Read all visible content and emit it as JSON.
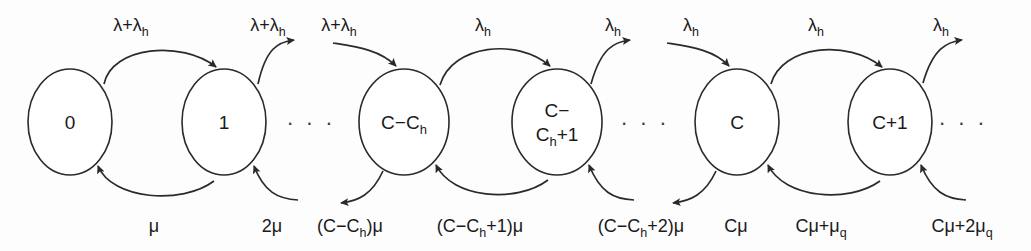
{
  "diagram": {
    "type": "markov-chain-state-transition-diagram",
    "title": "",
    "background_color": "#fdfdfd",
    "stroke_color": "#2a2a2a",
    "text_color": "#1a1a1a",
    "states": [
      {
        "id": "s0",
        "label": "0",
        "label_lines": [
          "0"
        ],
        "cx": 70,
        "cy": 122,
        "rx": 42,
        "ry": 53
      },
      {
        "id": "s1",
        "label": "1",
        "label_lines": [
          "1"
        ],
        "cx": 224,
        "cy": 122,
        "rx": 42,
        "ry": 53
      },
      {
        "id": "sCCh",
        "label": "C-C_h",
        "label_lines": [
          "C−C",
          "h"
        ],
        "cx": 404,
        "cy": 122,
        "rx": 45,
        "ry": 53
      },
      {
        "id": "sCCh1",
        "label": "C-C_h+1",
        "label_lines": [
          "C−",
          "C",
          "h",
          "+1"
        ],
        "cx": 557,
        "cy": 122,
        "rx": 45,
        "ry": 53
      },
      {
        "id": "sC",
        "label": "C",
        "label_lines": [
          "C"
        ],
        "cx": 737,
        "cy": 122,
        "rx": 42,
        "ry": 53
      },
      {
        "id": "sC1",
        "label": "C+1",
        "label_lines": [
          "C+1"
        ],
        "cx": 890,
        "cy": 122,
        "rx": 42,
        "ry": 53
      }
    ],
    "ellipses_gaps": [
      {
        "id": "gap1",
        "text": "· · ·",
        "x": 311,
        "y": 130
      },
      {
        "id": "gap2",
        "text": "· · ·",
        "x": 645,
        "y": 130
      },
      {
        "id": "gap3",
        "text": "· · ·",
        "x": 963,
        "y": 130
      }
    ],
    "arrival_labels": [
      {
        "id": "a1",
        "text": "λ+λ",
        "sub": "h",
        "x": 131,
        "y": 31,
        "kind": "lambda-plus-lambda-h"
      },
      {
        "id": "a2",
        "text": "λ+λ",
        "sub": "h",
        "x": 268,
        "y": 31,
        "kind": "lambda-plus-lambda-h"
      },
      {
        "id": "a3",
        "text": "λ+λ",
        "sub": "h",
        "x": 339,
        "y": 31,
        "kind": "lambda-plus-lambda-h"
      },
      {
        "id": "a4",
        "text": "λ",
        "sub": "h",
        "x": 483,
        "y": 31,
        "kind": "lambda-h"
      },
      {
        "id": "a5",
        "text": "λ",
        "sub": "h",
        "x": 613,
        "y": 31,
        "kind": "lambda-h"
      },
      {
        "id": "a6",
        "text": "λ",
        "sub": "h",
        "x": 691,
        "y": 31,
        "kind": "lambda-h"
      },
      {
        "id": "a7",
        "text": "λ",
        "sub": "h",
        "x": 816,
        "y": 31,
        "kind": "lambda-h"
      },
      {
        "id": "a8",
        "text": "λ",
        "sub": "h",
        "x": 941,
        "y": 31,
        "kind": "lambda-h"
      }
    ],
    "service_labels": [
      {
        "id": "d1",
        "parts": [
          {
            "t": "μ"
          }
        ],
        "x": 154,
        "y": 226
      },
      {
        "id": "d2",
        "parts": [
          {
            "t": "2μ"
          }
        ],
        "x": 272,
        "y": 226
      },
      {
        "id": "d3",
        "parts": [
          {
            "t": "(C−C"
          },
          {
            "t": "h",
            "sub": true
          },
          {
            "t": ")μ"
          }
        ],
        "x": 350,
        "y": 226
      },
      {
        "id": "d4",
        "parts": [
          {
            "t": "(C−C"
          },
          {
            "t": "h",
            "sub": true
          },
          {
            "t": "+1)μ"
          }
        ],
        "x": 480,
        "y": 226
      },
      {
        "id": "d5",
        "parts": [
          {
            "t": "(C−C"
          },
          {
            "t": "h",
            "sub": true
          },
          {
            "t": "+2)μ"
          }
        ],
        "x": 641,
        "y": 226
      },
      {
        "id": "d6",
        "parts": [
          {
            "t": "Cμ"
          }
        ],
        "x": 736,
        "y": 226
      },
      {
        "id": "d7",
        "parts": [
          {
            "t": "Cμ+μ"
          },
          {
            "t": "q",
            "sub": true
          }
        ],
        "x": 821,
        "y": 226
      },
      {
        "id": "d8",
        "parts": [
          {
            "t": "Cμ+2μ"
          },
          {
            "t": "q",
            "sub": true
          }
        ],
        "x": 962,
        "y": 226
      }
    ],
    "transitions_up": [
      {
        "id": "u1",
        "from": "0",
        "to": "1",
        "rate": "λ+λ_h"
      },
      {
        "id": "u2",
        "from": "1",
        "to": "(next)",
        "rate": "λ+λ_h"
      },
      {
        "id": "u3",
        "from": "(prev)",
        "to": "C-C_h",
        "rate": "λ+λ_h"
      },
      {
        "id": "u4",
        "from": "C-C_h",
        "to": "C-C_h+1",
        "rate": "λ_h"
      },
      {
        "id": "u5",
        "from": "C-C_h+1",
        "to": "(next)",
        "rate": "λ_h"
      },
      {
        "id": "u6",
        "from": "(prev)",
        "to": "C",
        "rate": "λ_h"
      },
      {
        "id": "u7",
        "from": "C",
        "to": "C+1",
        "rate": "λ_h"
      },
      {
        "id": "u8",
        "from": "C+1",
        "to": "(next)",
        "rate": "λ_h"
      }
    ],
    "transitions_down": [
      {
        "id": "v1",
        "from": "1",
        "to": "0",
        "rate": "μ"
      },
      {
        "id": "v2",
        "from": "(next)",
        "to": "1",
        "rate": "2μ"
      },
      {
        "id": "v3",
        "from": "C-C_h",
        "to": "(prev)",
        "rate": "(C−C_h)μ"
      },
      {
        "id": "v4",
        "from": "C-C_h+1",
        "to": "C-C_h",
        "rate": "(C−C_h+1)μ"
      },
      {
        "id": "v5",
        "from": "(next)",
        "to": "C-C_h+1",
        "rate": "(C−C_h+2)μ"
      },
      {
        "id": "v6",
        "from": "C",
        "to": "(prev)",
        "rate": "Cμ"
      },
      {
        "id": "v7",
        "from": "C+1",
        "to": "C",
        "rate": "Cμ+μ_q"
      },
      {
        "id": "v8",
        "from": "(next)",
        "to": "C+1",
        "rate": "Cμ+2μ_q"
      }
    ]
  }
}
